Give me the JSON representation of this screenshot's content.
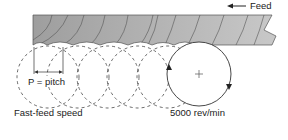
{
  "diagram": {
    "feed_label": "Feed",
    "pitch_label": "P = pitch",
    "speed_label": "Fast-feed speed",
    "rpm_label": "5000 rev/min",
    "colors": {
      "workpiece_light": "#c4c4c4",
      "workpiece_dark": "#9a9a9a",
      "line": "#333333"
    }
  }
}
